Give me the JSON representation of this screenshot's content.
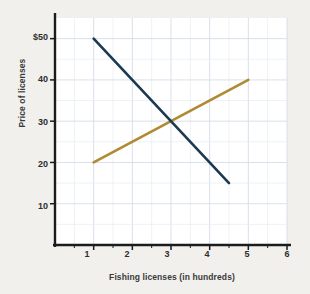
{
  "chart_data": {
    "type": "line",
    "title": "",
    "xlabel": "Fishing licenses (in hundreds)",
    "ylabel": "Price of licenses",
    "xlim": [
      0,
      6
    ],
    "ylim": [
      0,
      55
    ],
    "xticks": [
      "1",
      "2",
      "3",
      "4",
      "5",
      "6"
    ],
    "xtick_values": [
      1,
      2,
      3,
      4,
      5,
      6
    ],
    "yticks": [
      "$50",
      "40",
      "30",
      "20",
      "10"
    ],
    "ytick_values": [
      50,
      40,
      30,
      20,
      10
    ],
    "grid": true,
    "legend": "inline-curve-labels",
    "series": [
      {
        "name": "D",
        "label": "D",
        "role": "demand",
        "color": "#1b3a52",
        "x": [
          1,
          4.5
        ],
        "y": [
          50,
          15
        ],
        "points": [
          [
            1,
            50
          ],
          [
            4.5,
            15
          ]
        ]
      },
      {
        "name": "S",
        "label": "S",
        "role": "supply",
        "color": "#b08a32",
        "x": [
          1,
          5
        ],
        "y": [
          20,
          40
        ],
        "points": [
          [
            1,
            20
          ],
          [
            5,
            40
          ]
        ]
      }
    ],
    "annotations": [
      {
        "text": "S",
        "x": 5.12,
        "y": 40.5
      },
      {
        "text": "D",
        "x": 4.62,
        "y": 14.5
      }
    ],
    "equilibrium": {
      "x": 3,
      "y": 30
    }
  },
  "colors": {
    "background": "#f1f0ed",
    "plot_background": "#ffffff",
    "grid": "#d6dde6",
    "axis": "#1c1c1c",
    "demand": "#1b3a52",
    "supply": "#b08a32",
    "text": "#2e2e2e"
  }
}
